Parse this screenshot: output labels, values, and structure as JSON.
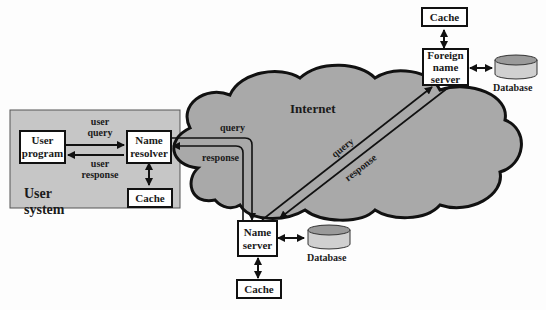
{
  "diagram": {
    "type": "dns-resolution-architecture",
    "colors": {
      "user_system_fill": "#c6c6c6",
      "cloud_fill": "#a9a9a9",
      "db_top": "#9a9a9a",
      "db_body": "#d0d0d0",
      "stroke": "#111111"
    },
    "user_system": {
      "title": "User system",
      "title_line1": "User",
      "title_line2": "system",
      "user_program": {
        "line1": "User",
        "line2": "program"
      },
      "name_resolver": {
        "line1": "Name",
        "line2": "resolver"
      },
      "cache": "Cache",
      "user_query": {
        "line1": "user",
        "line2": "query"
      },
      "user_response": {
        "line1": "user",
        "line2": "response"
      }
    },
    "internet": {
      "label": "Internet",
      "query_left": "query",
      "response_left": "response",
      "query_diag": "query",
      "response_diag": "response"
    },
    "name_server": {
      "line1": "Name",
      "line2": "server",
      "cache": "Cache",
      "database": "Database"
    },
    "foreign_name_server": {
      "line1": "Foreign",
      "line2": "name",
      "line3": "server",
      "cache": "Cache",
      "database": "Database"
    }
  }
}
